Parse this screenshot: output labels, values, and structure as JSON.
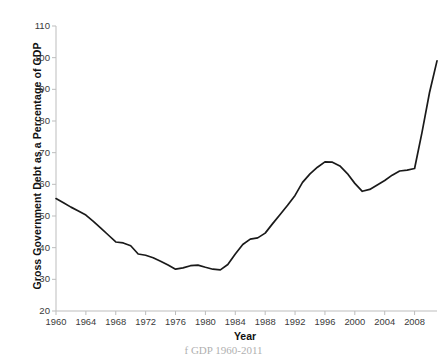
{
  "chart_data": {
    "type": "line",
    "title": "",
    "xlabel": "Year",
    "ylabel": "Gross Government Debt as a Percentage of GDP",
    "xlim": [
      1960,
      2011
    ],
    "ylim": [
      20,
      110
    ],
    "grid": false,
    "legend": null,
    "line_color": "#1a1a1a",
    "x_ticks": [
      1960,
      1964,
      1968,
      1972,
      1976,
      1980,
      1984,
      1988,
      1992,
      1996,
      2000,
      2004,
      2008
    ],
    "y_ticks": [
      20,
      30,
      40,
      50,
      60,
      70,
      80,
      90,
      100,
      110
    ],
    "x": [
      1960,
      1961,
      1962,
      1963,
      1964,
      1965,
      1966,
      1967,
      1968,
      1969,
      1970,
      1971,
      1972,
      1973,
      1974,
      1975,
      1976,
      1977,
      1978,
      1979,
      1980,
      1981,
      1982,
      1983,
      1984,
      1985,
      1986,
      1987,
      1988,
      1989,
      1990,
      1991,
      1992,
      1993,
      1994,
      1995,
      1996,
      1997,
      1998,
      1999,
      2000,
      2001,
      2002,
      2003,
      2004,
      2005,
      2006,
      2007,
      2008,
      2009,
      2010,
      2011
    ],
    "values": [
      55.5,
      54.2,
      52.8,
      51.6,
      50.3,
      48.3,
      46.2,
      44.0,
      41.8,
      41.5,
      40.6,
      38.0,
      37.6,
      36.8,
      35.7,
      34.5,
      33.2,
      33.6,
      34.3,
      34.5,
      33.8,
      33.2,
      33.0,
      34.7,
      38.0,
      41.0,
      42.7,
      43.1,
      44.6,
      47.6,
      50.5,
      53.4,
      56.5,
      60.6,
      63.3,
      65.4,
      67.1,
      67.0,
      65.8,
      63.4,
      60.3,
      57.8,
      58.4,
      59.8,
      61.2,
      62.9,
      64.2,
      64.5,
      65.0,
      76.5,
      89.0,
      99.0
    ]
  },
  "caption": "f GDP 1960-2011"
}
